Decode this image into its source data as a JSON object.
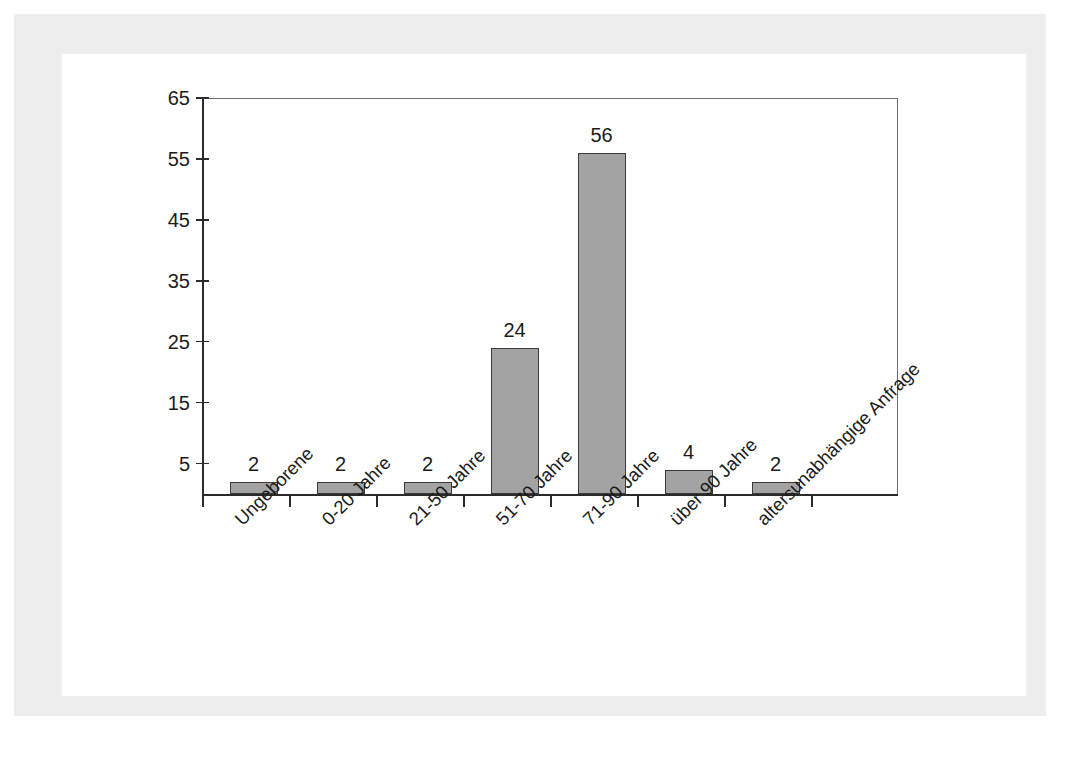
{
  "chart_data": {
    "type": "bar",
    "title": "",
    "subtitle": "",
    "xlabel": "",
    "ylabel": "",
    "categories": [
      "Ungeborene",
      "0-20 Jahre",
      "21-50 Jahre",
      "51-70 Jahre",
      "71-90 Jahre",
      "über 90 Jahre",
      "altersunabhängige Anfrage"
    ],
    "values": [
      2,
      2,
      2,
      24,
      56,
      4,
      2
    ],
    "data_labels": [
      "2",
      "2",
      "2",
      "24",
      "56",
      "4",
      "2"
    ],
    "ylim": [
      0,
      65
    ],
    "yticks": [
      5,
      15,
      25,
      35,
      45,
      55,
      65
    ],
    "ytick_labels": [
      "5",
      "15",
      "25",
      "35",
      "45",
      "55",
      "65"
    ],
    "grid": false,
    "legend": false,
    "legend_position": "none",
    "bar_color": "#a3a3a3",
    "bar_edge_color": "#3a3a3a",
    "axis_color": "#2b2b2b",
    "text_color": "#1b1b1b",
    "frame_color": "#ededee",
    "canvas_color": "#ffffff",
    "xtick_count": 8,
    "xlabel_rotation": -45
  }
}
